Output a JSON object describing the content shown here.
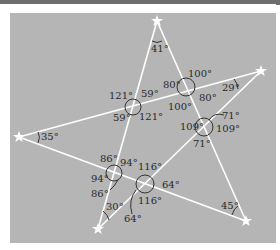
{
  "figure": {
    "type": "five-point star (pentagram) formed by five straight lines with angle measurements",
    "colors": {
      "background": "#b5b5b5",
      "lines": "#ffffff",
      "arcs": "#333333",
      "text": "#2a2a2a",
      "frame": "#6e6e6e"
    },
    "vertices": [
      {
        "id": "top",
        "x": 157,
        "y": 21,
        "angle": "41°",
        "label_x": 151,
        "label_y": 52
      },
      {
        "id": "right",
        "x": 261,
        "y": 71,
        "angle": "29°",
        "label_x": 222,
        "label_y": 91
      },
      {
        "id": "left",
        "x": 19,
        "y": 137,
        "angle": "35°",
        "label_x": 41,
        "label_y": 140
      },
      {
        "id": "bottom-left",
        "x": 98,
        "y": 229,
        "angle": "30°",
        "label_x": 106,
        "label_y": 210
      },
      {
        "id": "bottom-right",
        "x": 246,
        "y": 221,
        "angle": "45°",
        "label_x": 221,
        "label_y": 209
      }
    ],
    "intersections": [
      {
        "id": "upper-left",
        "x": 133,
        "y": 107,
        "angles": [
          {
            "value": "121°",
            "x": 109,
            "y": 99
          },
          {
            "value": "59°",
            "x": 141,
            "y": 97
          },
          {
            "value": "59°",
            "x": 113,
            "y": 121
          },
          {
            "value": "121°",
            "x": 139,
            "y": 120
          }
        ]
      },
      {
        "id": "upper-right",
        "x": 186,
        "y": 87,
        "angles": [
          {
            "value": "100°",
            "x": 188,
            "y": 77
          },
          {
            "value": "80°",
            "x": 163,
            "y": 88
          },
          {
            "value": "80°",
            "x": 199,
            "y": 101
          },
          {
            "value": "100°",
            "x": 168,
            "y": 110
          }
        ]
      },
      {
        "id": "right-middle",
        "x": 204,
        "y": 127,
        "angles": [
          {
            "value": "71°",
            "x": 222,
            "y": 119
          },
          {
            "value": "109°",
            "x": 180,
            "y": 129
          },
          {
            "value": "109°",
            "x": 216,
            "y": 132
          },
          {
            "value": "71°",
            "x": 193,
            "y": 147
          }
        ]
      },
      {
        "id": "lower-left",
        "x": 114,
        "y": 173,
        "angles": [
          {
            "value": "86°",
            "x": 100,
            "y": 162
          },
          {
            "value": "94°",
            "x": 120,
            "y": 167
          },
          {
            "value": "94°",
            "x": 91,
            "y": 182
          },
          {
            "value": "86°",
            "x": 91,
            "y": 197
          }
        ]
      },
      {
        "id": "lower-middle",
        "x": 145,
        "y": 184,
        "angles": [
          {
            "value": "116°",
            "x": 138,
            "y": 169
          },
          {
            "value": "64°",
            "x": 162,
            "y": 188
          },
          {
            "value": "116°",
            "x": 138,
            "y": 204
          },
          {
            "value": "64°",
            "x": 124,
            "y": 222
          }
        ]
      }
    ],
    "lines": [
      {
        "from": "top",
        "to": "bottom-left"
      },
      {
        "from": "top",
        "to": "bottom-right"
      },
      {
        "from": "left",
        "to": "right"
      },
      {
        "from": "left",
        "to": "bottom-right"
      },
      {
        "from": "right",
        "to": "bottom-left"
      }
    ]
  },
  "labels": {
    "top_angle": "41°",
    "right_angle": "29°",
    "left_angle": "35°",
    "bottom_left_angle": "30°",
    "bottom_right_angle": "45°",
    "ul_121a": "121°",
    "ul_59a": "59°",
    "ul_59b": "59°",
    "ul_121b": "121°",
    "ur_100a": "100°",
    "ur_80a": "80°",
    "ur_80b": "80°",
    "ur_100b": "100°",
    "rm_71a": "71°",
    "rm_109a": "109°",
    "rm_109b": "109°",
    "rm_71b": "71°",
    "ll_86a": "86°",
    "ll_94a": "94°",
    "ll_94b": "94°",
    "ll_86b": "86°",
    "lm_116a": "116°",
    "lm_64a": "64°",
    "lm_116b": "116°",
    "lm_64b": "64°"
  }
}
